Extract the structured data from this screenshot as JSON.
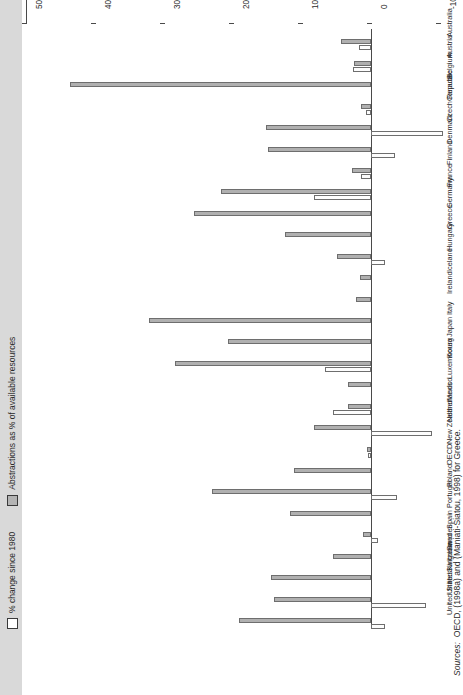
{
  "legend": {
    "items": [
      {
        "label": "% change since 1980",
        "style": "white",
        "color": "#ffffff"
      },
      {
        "label": "Abstractions as % of available resources",
        "style": "gray",
        "color": "#b4b4b4"
      }
    ]
  },
  "axis": {
    "ticks": [
      "-10",
      "0",
      "10",
      "20",
      "30",
      "40",
      "50"
    ],
    "min": -10,
    "max": 50
  },
  "sources": {
    "label": "Sources:",
    "text": "OECD, (1998a) and (Maniati-Siatou, 1998) for Greece."
  },
  "chart_data": {
    "type": "bar",
    "title": "",
    "xlabel": "",
    "ylabel": "",
    "ylim": [
      -10,
      50
    ],
    "grid": false,
    "orientation": "vertical-printed-sideways",
    "legend_position": "top-left",
    "categories": [
      "United States",
      "United Kingdom",
      "Switzerland",
      "Sweden",
      "Spain",
      "Portugal",
      "Poland",
      "OECD",
      "New Zealand",
      "Netherlands",
      "Mexico",
      "Luxembourg",
      "Korea",
      "Japan",
      "Italy",
      "Ireland",
      "Iceland",
      "Hungary",
      "Greece",
      "Germany",
      "France",
      "Finland",
      "Denmark",
      "Czech Republic",
      "Canada",
      "Belgium",
      "Austria",
      "Australia"
    ],
    "series": [
      {
        "name": "Abstractions as % of available resources",
        "color": "#b0b0b0",
        "values": [
          19.2,
          14.1,
          14.5,
          5.5,
          1.2,
          11.8,
          23.0,
          11.2,
          0.6,
          8.2,
          3.3,
          3.3,
          28.4,
          20.7,
          32.2,
          2.2,
          1.6,
          5.0,
          12.5,
          25.7,
          21.8,
          2.8,
          15.0,
          15.2,
          1.5,
          43.6,
          2.4,
          4.3
        ]
      },
      {
        "name": "% change since 1980",
        "color": "#fdfdfd",
        "values": [
          -2.0,
          -8.0,
          0.0,
          0.0,
          -1.0,
          0.0,
          -3.8,
          0.0,
          0.4,
          -8.8,
          5.5,
          0.0,
          6.6,
          0.0,
          0.0,
          0.0,
          0.0,
          -2.0,
          0.0,
          0.0,
          8.2,
          1.4,
          -3.5,
          -10.5,
          0.7,
          0.0,
          2.6,
          1.7
        ]
      }
    ]
  }
}
